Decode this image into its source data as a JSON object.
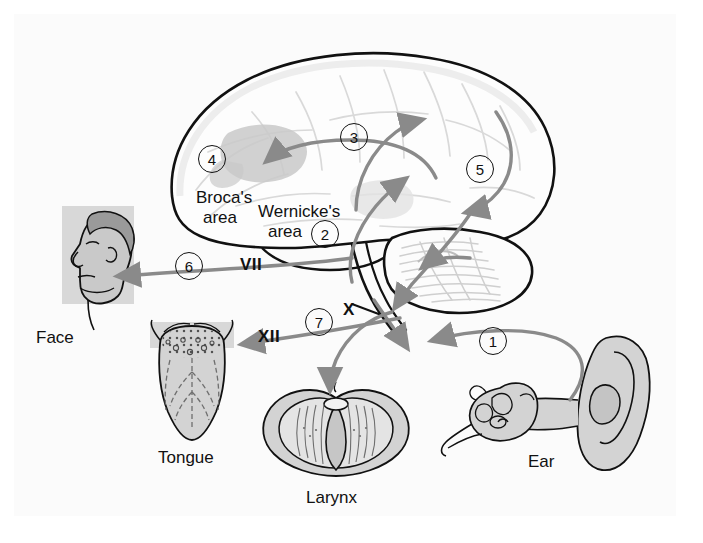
{
  "figure": {
    "domain_title": "Speech and language pathway of the brain",
    "background": "#ffffff",
    "plate_background": "#fbfbfb",
    "ink": "#111111",
    "arrow_color": "#8a8a8a",
    "shade_color": "#c9c9c9",
    "organ_fill": "#d3d3d3"
  },
  "labels": {
    "brocas_line1": "Broca's",
    "brocas_line2": "area",
    "wernickes_line1": "Wernicke's",
    "wernickes_line2": "area",
    "face": "Face",
    "tongue": "Tongue",
    "larynx": "Larynx",
    "ear": "Ear"
  },
  "nerves": [
    {
      "id": "facial-nerve",
      "label": "VII",
      "x": 240,
      "y": 255
    },
    {
      "id": "vagus-nerve",
      "label": "X",
      "x": 343,
      "y": 300
    },
    {
      "id": "hypoglossal-nerve",
      "label": "XII",
      "x": 258,
      "y": 327
    }
  ],
  "steps": [
    {
      "n": "1",
      "x": 479,
      "y": 327,
      "desc": "auditory input at ear"
    },
    {
      "n": "2",
      "x": 311,
      "y": 220,
      "desc": "Wernicke's area comprehension"
    },
    {
      "n": "3",
      "x": 340,
      "y": 123,
      "desc": "arcuate fasciculus transfer"
    },
    {
      "n": "4",
      "x": 198,
      "y": 145,
      "desc": "Broca's area speech planning"
    },
    {
      "n": "5",
      "x": 466,
      "y": 155,
      "desc": "motor cortex output"
    },
    {
      "n": "6",
      "x": 175,
      "y": 252,
      "desc": "facial nerve to face"
    },
    {
      "n": "7",
      "x": 305,
      "y": 308,
      "desc": "vagus nerve to larynx"
    }
  ],
  "organs": [
    {
      "id": "face",
      "label": "Face"
    },
    {
      "id": "tongue",
      "label": "Tongue"
    },
    {
      "id": "larynx",
      "label": "Larynx"
    },
    {
      "id": "ear",
      "label": "Ear"
    }
  ]
}
